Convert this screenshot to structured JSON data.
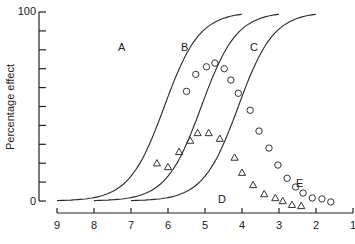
{
  "chart_data": {
    "type": "scatter",
    "title": "",
    "xlabel": "",
    "ylabel": "Percentage effect",
    "xlim": [
      9,
      1
    ],
    "ylim": [
      0,
      100
    ],
    "x_ticks": [
      "9",
      "8",
      "7",
      "6",
      "5",
      "4",
      "3",
      "2",
      "1"
    ],
    "y_ticks": [
      "0",
      "100"
    ],
    "y_minor_tick_count": 11,
    "grid": false,
    "legend": null,
    "curves": [
      {
        "name": "A",
        "type": "sigmoid",
        "ec50_x": 6.1,
        "x_range": [
          9,
          4.0
        ]
      },
      {
        "name": "B",
        "type": "sigmoid",
        "ec50_x": 5.1,
        "x_range": [
          8,
          3.0
        ]
      },
      {
        "name": "C",
        "type": "sigmoid",
        "ec50_x": 4.1,
        "x_range": [
          7,
          2.0
        ]
      }
    ],
    "series": [
      {
        "name": "D",
        "marker": "triangle",
        "x": [
          6.3,
          6.0,
          5.7,
          5.4,
          5.2,
          4.9,
          4.6,
          4.2,
          4.0,
          3.7,
          3.4,
          3.1,
          2.9,
          2.65,
          2.4
        ],
        "y": [
          20,
          18,
          26,
          32,
          36,
          36,
          33,
          23,
          15,
          8.5,
          3.7,
          1.6,
          0,
          -2,
          -2.6
        ]
      },
      {
        "name": "E",
        "marker": "circle",
        "x": [
          5.5,
          5.25,
          4.96,
          4.73,
          4.48,
          4.3,
          4.1,
          3.78,
          3.54,
          3.27,
          3.03,
          2.78,
          2.55,
          2.35,
          2.1,
          1.84,
          1.6
        ],
        "y": [
          58,
          67,
          71,
          73,
          70,
          64,
          57,
          48,
          37,
          28,
          19,
          12,
          7.4,
          4.2,
          1.6,
          1.1,
          -0.5
        ]
      }
    ],
    "annotations": [
      {
        "text": "A",
        "x": 5.85,
        "y": 84
      },
      {
        "text": "B",
        "x": 5.15,
        "y": 84
      },
      {
        "text": "C",
        "x": 4.3,
        "y": 84
      },
      {
        "text": "D",
        "x": 4.45,
        "y": -6
      },
      {
        "text": "E",
        "x": 2.2,
        "y": 6
      }
    ]
  },
  "labels": {
    "ylabel": "Percentage effect",
    "y_top": "100",
    "y_bottom": "0",
    "x_ticks": [
      "9",
      "8",
      "7",
      "6",
      "5",
      "4",
      "3",
      "2",
      "1"
    ],
    "curve_A": "A",
    "curve_B": "B",
    "curve_C": "C",
    "series_D": "D",
    "series_E": "E"
  }
}
